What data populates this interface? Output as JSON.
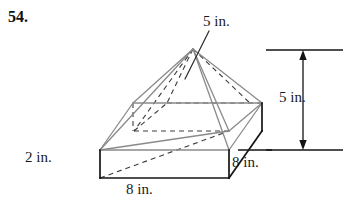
{
  "problem": {
    "number": "54."
  },
  "figure": {
    "colors": {
      "outline_dark": "#141414",
      "outline_gray": "#8a8a8a",
      "hidden_dash": "#3c3c3c",
      "dimension_line": "#141414",
      "background": "#ffffff"
    }
  },
  "labels": {
    "pyramid_slant": "5 in.",
    "total_height": "5 in.",
    "prism_depth": "8 in.",
    "prism_thickness": "2 in.",
    "prism_width": "8 in."
  },
  "geometry": {
    "apex": {
      "x": 193,
      "y": 49
    },
    "prism_top": {
      "front_left": {
        "x": 100,
        "y": 150
      },
      "front_right": {
        "x": 229,
        "y": 150
      },
      "back_right": {
        "x": 262,
        "y": 103
      },
      "back_left": {
        "x": 133,
        "y": 103
      }
    },
    "prism_bottom": {
      "front_left": {
        "x": 100,
        "y": 178
      },
      "front_right": {
        "x": 229,
        "y": 178
      },
      "back_right": {
        "x": 262,
        "y": 131
      }
    },
    "pyramid_base": {
      "front_left": {
        "x": 134,
        "y": 131
      },
      "front_right": {
        "x": 229,
        "y": 131
      },
      "back_right": {
        "x": 262,
        "y": 103
      },
      "back_left": {
        "x": 167,
        "y": 103
      }
    },
    "dimension_line": {
      "x": 303,
      "top_y": 50,
      "bottom_y": 150,
      "top_extension": {
        "x1": 266,
        "x2": 343,
        "y": 50
      },
      "bottom_extension": {
        "x1": 266,
        "x2": 343,
        "y": 150
      }
    },
    "leader_line": {
      "from": {
        "x": 207,
        "y": 31
      },
      "to": {
        "x": 184,
        "y": 79
      }
    }
  }
}
